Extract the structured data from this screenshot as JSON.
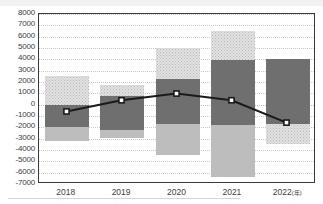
{
  "chart_data": {
    "type": "bar",
    "title": "",
    "subtitle": "",
    "xlabel": "",
    "ylabel": "",
    "ylim": [
      -7000,
      8000
    ],
    "ytick_step": 1000,
    "grid": true,
    "legend_position": "none",
    "categories": [
      "2018",
      "2019",
      "2020",
      "2021",
      "2022"
    ],
    "category_labels": [
      "2018",
      "2019",
      "2020",
      "2021",
      "2022(年)"
    ],
    "yticks": [
      "8000",
      "7000",
      "6000",
      "5000",
      "4000",
      "3000",
      "2000",
      "1000",
      "0",
      "-1000",
      "-2000",
      "-3000",
      "-4000",
      "-5000",
      "-6000",
      "-7000"
    ],
    "ytick_values": [
      8000,
      7000,
      6000,
      5000,
      4000,
      3000,
      2000,
      1000,
      0,
      -1000,
      -2000,
      -3000,
      -4000,
      -5000,
      -6000,
      -7000
    ],
    "series": [
      {
        "name": "upper-band",
        "style": "dotted-light",
        "color": "#e2e2e2",
        "tops": [
          2500,
          1700,
          5000,
          6500,
          4000
        ],
        "bottoms": [
          0,
          800,
          2300,
          3900,
          400
        ]
      },
      {
        "name": "mid-band",
        "style": "solid-dark",
        "color": "#6f6f6f",
        "tops": [
          0,
          800,
          2300,
          3900,
          4000
        ],
        "bottoms": [
          -2000,
          -2200,
          -1700,
          -1800,
          -1700
        ]
      },
      {
        "name": "lower-band",
        "style": "solid-light",
        "color": "#bdbdbd",
        "tops": [
          -2000,
          -2200,
          -1700,
          -1800,
          -1700
        ],
        "bottoms": [
          -3200,
          -2900,
          -4400,
          -6400,
          -3500
        ]
      }
    ],
    "line_series": {
      "name": "trend",
      "color": "#1a1a1a",
      "marker": "square-white",
      "values": [
        -700,
        300,
        900,
        300,
        -1700
      ]
    }
  },
  "axis": {
    "y_axis_name": "value-axis",
    "x_axis_name": "year-axis"
  }
}
